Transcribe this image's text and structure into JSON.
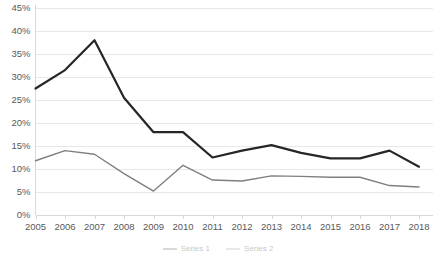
{
  "chart_data": {
    "type": "line",
    "title": "",
    "subtitle": "",
    "xlabel": "",
    "ylabel": "",
    "x": [
      2005,
      2006,
      2007,
      2008,
      2009,
      2010,
      2011,
      2012,
      2013,
      2014,
      2015,
      2016,
      2017,
      2018
    ],
    "categories": [
      "2005",
      "2006",
      "2007",
      "2008",
      "2009",
      "2010",
      "2011",
      "2012",
      "2013",
      "2014",
      "2015",
      "2016",
      "2017",
      "2018"
    ],
    "ylim": [
      0,
      45
    ],
    "ytick_values": [
      0,
      5,
      10,
      15,
      20,
      25,
      30,
      35,
      40,
      45
    ],
    "ytick_labels": [
      "0%",
      "5%",
      "10%",
      "15%",
      "20%",
      "25%",
      "30%",
      "35%",
      "40%",
      "45%"
    ],
    "grid": true,
    "grid_axis": "y",
    "legend_position": "bottom",
    "series": [
      {
        "name": "Series 1",
        "color": "#262626",
        "width": 2.2,
        "values": [
          27.5,
          31.5,
          38.0,
          25.5,
          18.0,
          18.0,
          12.5,
          14.0,
          15.2,
          13.5,
          12.3,
          12.3,
          14.0,
          10.5
        ]
      },
      {
        "name": "Series 2",
        "color": "#7f7f7f",
        "width": 1.4,
        "values": [
          11.8,
          14.0,
          13.2,
          9.0,
          5.2,
          10.8,
          7.6,
          7.4,
          8.5,
          8.4,
          8.2,
          8.2,
          6.4,
          6.1
        ]
      }
    ]
  },
  "axes": {
    "y_tick_labels": [
      "45%",
      "40%",
      "35%",
      "30%",
      "25%",
      "20%",
      "15%",
      "10%",
      "5%",
      "0%"
    ],
    "x_tick_labels": [
      "2005",
      "2006",
      "2007",
      "2008",
      "2009",
      "2010",
      "2011",
      "2012",
      "2013",
      "2014",
      "2015",
      "2016",
      "2017",
      "2018"
    ]
  },
  "legend": {
    "items": [
      {
        "label": "Series 1",
        "color": "#262626"
      },
      {
        "label": "Series 2",
        "color": "#7f7f7f"
      }
    ]
  },
  "style": {
    "grid_color": "#e8e8e8",
    "axis_color": "#d9d9d9",
    "text_color": "#595959",
    "background": "#ffffff"
  }
}
